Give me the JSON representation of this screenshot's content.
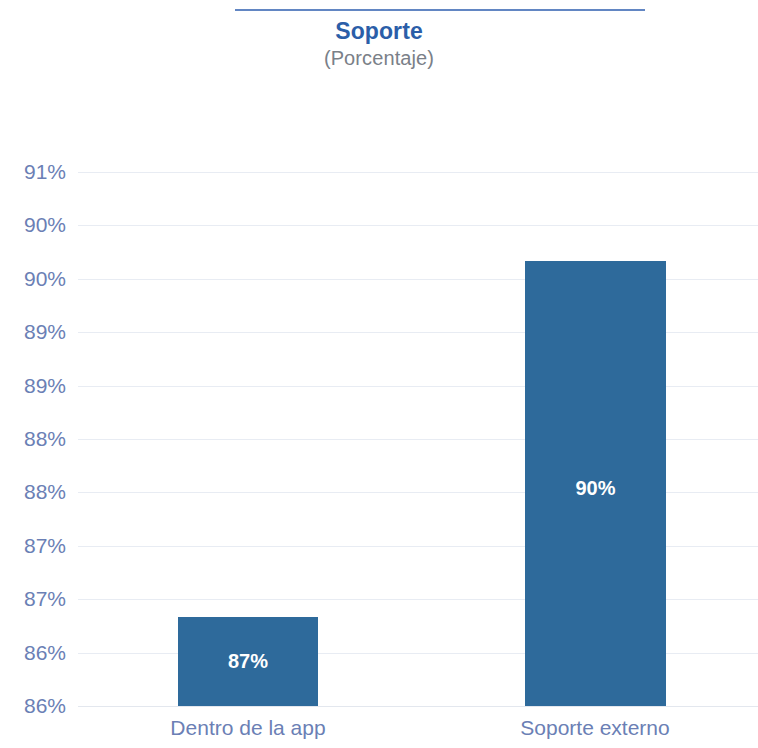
{
  "header": {
    "title": "Soporte",
    "subtitle": "(Porcentaje)",
    "rule_color": "#5a7fc0",
    "title_color": "#2b5ea8",
    "subtitle_color": "#7a8088"
  },
  "chart_data": {
    "type": "bar",
    "title": "Soporte",
    "subtitle": "(Porcentaje)",
    "xlabel": "",
    "ylabel": "",
    "categories": [
      "Dentro de la app",
      "Soporte externo"
    ],
    "values": [
      87,
      90
    ],
    "value_labels": [
      "87%",
      "90%"
    ],
    "ytick_labels": [
      "91%",
      "90%",
      "90%",
      "89%",
      "89%",
      "88%",
      "88%",
      "87%",
      "87%",
      "86%",
      "86%"
    ],
    "ytick_values": [
      90.75,
      90.4,
      90.05,
      89.7,
      89.35,
      88.0,
      87.65,
      87.3,
      86.95,
      86.6,
      86.25
    ],
    "ylim": [
      86.25,
      90.75
    ],
    "grid": true,
    "legend": false,
    "bar_color": "#2e6a9b",
    "tick_color": "#6b7fb5",
    "gridline_color": "#e8ecf3"
  }
}
